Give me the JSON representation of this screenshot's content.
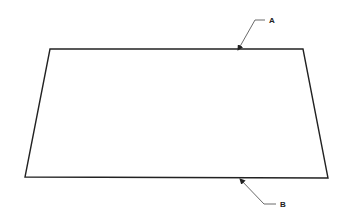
{
  "diagram": {
    "shape": {
      "type": "trapezoid",
      "points": [
        [
          50,
          49
        ],
        [
          303,
          49
        ],
        [
          328,
          178
        ],
        [
          25,
          177
        ]
      ],
      "stroke": "#222222"
    },
    "callouts": [
      {
        "label": "A",
        "target_edge": "top",
        "arrow_tip": [
          238,
          50
        ],
        "elbow": [
          255,
          20
        ],
        "end": [
          265,
          20
        ],
        "text_pos": [
          269,
          23
        ]
      },
      {
        "label": "B",
        "target_edge": "bottom",
        "arrow_tip": [
          240,
          179
        ],
        "elbow": [
          264,
          204
        ],
        "end": [
          276,
          204
        ],
        "text_pos": [
          280,
          207
        ]
      }
    ]
  }
}
